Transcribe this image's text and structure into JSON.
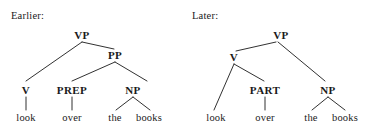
{
  "figure": {
    "width": 379,
    "height": 138,
    "background": "#ffffff",
    "ink_color": "#1a1a1a"
  },
  "panels": [
    {
      "caption": "Earlier:",
      "nodes": {
        "root": "VP",
        "pp": "PP",
        "v": "V",
        "prep": "PREP",
        "np": "NP"
      },
      "terminals": {
        "look": "look",
        "over": "over",
        "the": "the",
        "books": "books"
      }
    },
    {
      "caption": "Later:",
      "nodes": {
        "root": "VP",
        "v": "V",
        "part": "PART",
        "np": "NP"
      },
      "terminals": {
        "look": "look",
        "over": "over",
        "the": "the",
        "books": "books"
      }
    }
  ]
}
